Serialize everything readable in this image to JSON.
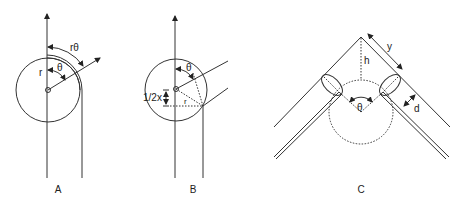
{
  "figure": {
    "panels": [
      {
        "id": "A",
        "label": "A",
        "annotations": {
          "arc_length": "rθ",
          "angle": "θ",
          "radius": "r"
        }
      },
      {
        "id": "B",
        "label": "B",
        "annotations": {
          "angle": "θ",
          "half_x": "1/2x",
          "radius": "r"
        }
      },
      {
        "id": "C",
        "label": "C",
        "annotations": {
          "slant_length": "y",
          "height": "h",
          "angle": "θ",
          "thickness": "d"
        }
      }
    ],
    "colors": {
      "stroke": "#333333",
      "background": "#ffffff"
    }
  }
}
